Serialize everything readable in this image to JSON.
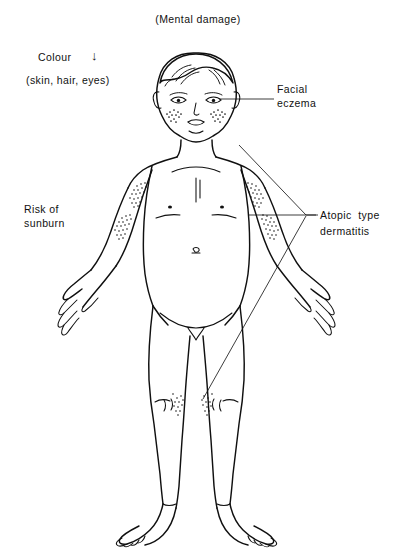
{
  "figure": {
    "type": "anatomical-line-drawing"
  },
  "annotations": {
    "mental_damage": "(Mental damage)",
    "colour": "Colour",
    "colour_arrow": "↓",
    "colour_sub": "(skin, hair, eyes)",
    "facial_eczema_line1": "Facial",
    "facial_eczema_line2": "eczema",
    "sunburn_line1": "Risk of",
    "sunburn_line2": "sunburn",
    "atopic_line1": "Atopic  type",
    "atopic_line2": "dermatitis"
  },
  "affected_sites": [
    {
      "name": "left-cheek-eczema",
      "region": "face"
    },
    {
      "name": "right-cheek-eczema",
      "region": "face"
    },
    {
      "name": "left-upper-arm-dermatitis",
      "region": "shoulder"
    },
    {
      "name": "right-upper-arm-dermatitis",
      "region": "shoulder"
    },
    {
      "name": "left-elbow-dermatitis",
      "region": "antecubital"
    },
    {
      "name": "right-elbow-dermatitis",
      "region": "antecubital"
    },
    {
      "name": "left-knee-dermatitis",
      "region": "popliteal"
    },
    {
      "name": "right-knee-dermatitis",
      "region": "popliteal"
    }
  ],
  "colors": {
    "background": "#ffffff",
    "ink": "#101010",
    "leader": "#1a1a1a"
  }
}
